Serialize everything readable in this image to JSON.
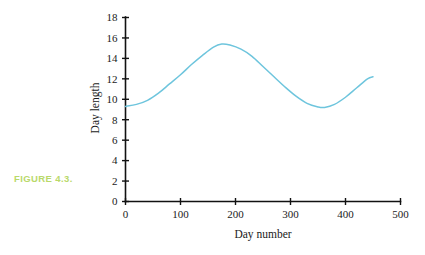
{
  "figure": {
    "caption": "FIGURE 4.3.",
    "caption_color": "#b9d96a"
  },
  "chart_data": {
    "type": "line",
    "title": "",
    "subtitle": "",
    "xlabel": "Day number",
    "ylabel": "Day length",
    "xlim": [
      0,
      500
    ],
    "ylim": [
      0,
      18
    ],
    "xticks": [
      "0",
      "100",
      "200",
      "300",
      "400",
      "500"
    ],
    "xtick_values": [
      0,
      100,
      200,
      300,
      400,
      500
    ],
    "yticks": [
      "0",
      "2",
      "4",
      "6",
      "8",
      "10",
      "12",
      "14",
      "16",
      "18"
    ],
    "ytick_values": [
      0,
      2,
      4,
      6,
      8,
      10,
      12,
      14,
      16,
      18
    ],
    "grid": false,
    "legend": "none",
    "line_color": "#6ec5dd",
    "series": [
      {
        "name": "Day length",
        "x": [
          0,
          20,
          40,
          60,
          80,
          100,
          120,
          140,
          160,
          175,
          190,
          210,
          230,
          250,
          270,
          290,
          310,
          330,
          350,
          362,
          380,
          400,
          420,
          440,
          450
        ],
        "y": [
          9.3,
          9.5,
          9.9,
          10.6,
          11.5,
          12.4,
          13.4,
          14.3,
          15.1,
          15.4,
          15.3,
          14.9,
          14.2,
          13.2,
          12.2,
          11.2,
          10.3,
          9.6,
          9.25,
          9.2,
          9.5,
          10.2,
          11.1,
          12.0,
          12.2
        ]
      }
    ],
    "annotations": []
  }
}
